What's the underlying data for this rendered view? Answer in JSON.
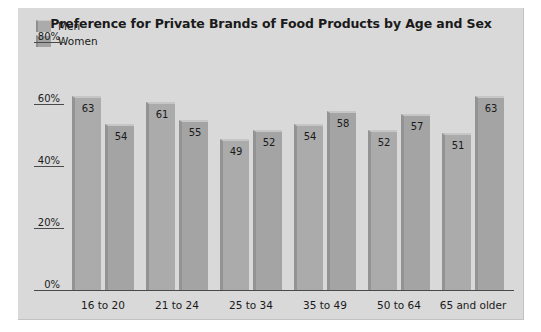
{
  "chart_data": {
    "type": "bar",
    "title": "Preference for Private Brands of Food Products by Age and Sex",
    "xlabel": "",
    "ylabel": "",
    "ylim": [
      0,
      80
    ],
    "grid": false,
    "legend_position": "top-left",
    "ytick_labels": [
      "0%",
      "20%",
      "40%",
      "60%",
      "80%"
    ],
    "ytick_values": [
      0,
      20,
      40,
      60,
      80
    ],
    "categories": [
      "16 to 20",
      "21 to 24",
      "25 to 34",
      "35 to 49",
      "50 to 64",
      "65 and older"
    ],
    "series": [
      {
        "name": "Men",
        "values": [
          63,
          61,
          49,
          54,
          52,
          51
        ]
      },
      {
        "name": "Women",
        "values": [
          54,
          55,
          52,
          58,
          57,
          63
        ]
      }
    ],
    "colors": {
      "men_bar": "#ababab",
      "women_bar": "#a4a4a4",
      "panel_background": "#d9d9d9",
      "axis": "#4a4a4a",
      "text": "#1a1a1a"
    }
  }
}
